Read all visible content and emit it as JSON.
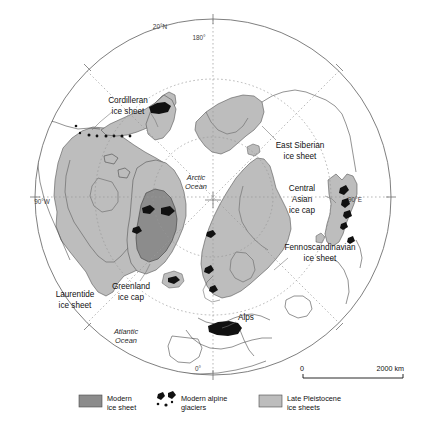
{
  "figure": {
    "type": "thematic-map",
    "projection": "north-polar-azimuthal",
    "background_color": "#ffffff"
  },
  "colors": {
    "modern_ice_sheet": "#8c8c8c",
    "late_pleistocene_ice": "#bdbdbd",
    "alpine_glacier": "#111111",
    "coastline": "#4a4a4a",
    "graticule": "#9a9a9a",
    "outer_circle": "#707070",
    "text": "#111111"
  },
  "map": {
    "ice_sheet_labels": [
      {
        "id": "cordilleran",
        "line1": "Cordilleran",
        "line2": "ice sheet",
        "x": 128,
        "y": 103
      },
      {
        "id": "east-siberian",
        "line1": "East Siberian",
        "line2": "ice sheet",
        "x": 300,
        "y": 148
      },
      {
        "id": "central-asian",
        "line1": "Central",
        "line2": "Asian",
        "line3": "ice cap",
        "x": 302,
        "y": 191
      },
      {
        "id": "fennoscandinavian",
        "line1": "Fennoscandinavian",
        "line2": "ice sheet",
        "x": 320,
        "y": 250
      },
      {
        "id": "greenland",
        "line1": "Greenland",
        "line2": "ice cap",
        "x": 131,
        "y": 289
      },
      {
        "id": "laurentide",
        "line1": "Laurentide",
        "line2": "ice sheet",
        "x": 75,
        "y": 297
      },
      {
        "id": "alps",
        "line1": "Alps",
        "x": 246,
        "y": 320
      }
    ],
    "ocean_labels": [
      {
        "id": "arctic-ocean",
        "line1": "Arctic",
        "line2": "Ocean",
        "x": 196,
        "y": 180
      },
      {
        "id": "atlantic-ocean",
        "line1": "Atlantic",
        "line2": "Ocean",
        "x": 126,
        "y": 334
      }
    ],
    "graticule_labels": [
      {
        "id": "lat-20n",
        "text": "20°N",
        "x": 160,
        "y": 29
      },
      {
        "id": "lon-180",
        "text": "180°",
        "x": 199,
        "y": 40
      },
      {
        "id": "lon-90w",
        "text": "90°W",
        "x": 42,
        "y": 204
      },
      {
        "id": "lon-90e",
        "text": "90°E",
        "x": 355,
        "y": 202
      },
      {
        "id": "lon-0",
        "text": "0°",
        "x": 198,
        "y": 371
      }
    ]
  },
  "scale_bar": {
    "start_label": "0",
    "end_label": "2000 km",
    "x": 303,
    "y": 374,
    "length_px": 100
  },
  "legend": {
    "items": [
      {
        "id": "modern-ice-sheet",
        "swatch": "fill-swatch",
        "color": "#8c8c8c",
        "line1": "Modern",
        "line2": "ice sheet"
      },
      {
        "id": "modern-alpine-glaciers",
        "swatch": "blob-icon",
        "color": "#111111",
        "line1": "Modern alpine",
        "line2": "glaciers"
      },
      {
        "id": "late-pleistocene-ice-sheets",
        "swatch": "fill-swatch",
        "color": "#bdbdbd",
        "line1": "Late Pleistocene",
        "line2": "ice sheets"
      }
    ]
  }
}
